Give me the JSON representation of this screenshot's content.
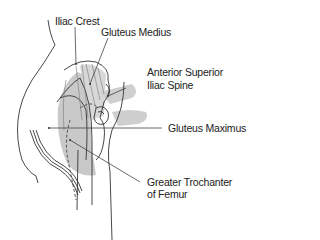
{
  "diagram": {
    "colors": {
      "muscle_shading": "#c8c8c8",
      "outline": "#333333",
      "leader_line": "#444444",
      "background": "#ffffff"
    },
    "labels": [
      {
        "id": "iliac-crest",
        "text": "Iliac Crest"
      },
      {
        "id": "gluteus-medius",
        "text": "Gluteus Medius"
      },
      {
        "id": "asis-line1",
        "text": "Anterior Superior"
      },
      {
        "id": "asis-line2",
        "text": "Iliac Spine"
      },
      {
        "id": "gluteus-maximus",
        "text": "Gluteus Maximus"
      },
      {
        "id": "greater-trochanter-line1",
        "text": "Greater Trochanter"
      },
      {
        "id": "greater-trochanter-line2",
        "text": "of Femur"
      }
    ]
  }
}
